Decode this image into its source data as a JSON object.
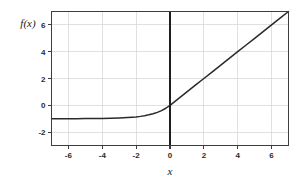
{
  "chart_data": {
    "type": "line",
    "title": "",
    "subtitle": "",
    "xlabel": "x",
    "ylabel": "f(x)",
    "xlim": [
      -7,
      7
    ],
    "ylim": [
      -3,
      7
    ],
    "xticks": [
      -6,
      -4,
      -2,
      0,
      2,
      4,
      6
    ],
    "xtick_labels": [
      "-6",
      "-4",
      "-2",
      "0",
      "2",
      "4",
      "6"
    ],
    "yticks": [
      -2,
      0,
      2,
      4,
      6
    ],
    "ytick_labels": [
      "-2",
      "0",
      "2",
      "4",
      "6"
    ],
    "grid": true,
    "legend": null,
    "legend_position": "none",
    "annotations": [],
    "colors": {
      "curve": "#2a2a2a",
      "grid": "#d8d8d8",
      "frame": "#3d3d3d",
      "zero_axis": "#1e1e1e",
      "background": "#ffffff",
      "text": "#2b2b2b"
    },
    "series": [
      {
        "name": "f(x)",
        "description": "ELU activation: f(x) = x for x >= 0, f(x) = exp(x) - 1 for x < 0",
        "asymptote_y": -1,
        "x": [
          -7,
          -6.5,
          -6,
          -5.5,
          -5,
          -4.5,
          -4,
          -3.5,
          -3,
          -2.75,
          -2.5,
          -2.25,
          -2,
          -1.75,
          -1.5,
          -1.25,
          -1,
          -0.75,
          -0.5,
          -0.25,
          0,
          0.5,
          1,
          1.5,
          2,
          2.5,
          3,
          3.5,
          4,
          4.5,
          5,
          5.5,
          6,
          6.5,
          7
        ],
        "y": [
          -0.999,
          -0.998,
          -0.998,
          -0.996,
          -0.993,
          -0.989,
          -0.982,
          -0.97,
          -0.95,
          -0.936,
          -0.918,
          -0.895,
          -0.865,
          -0.826,
          -0.777,
          -0.713,
          -0.632,
          -0.528,
          -0.393,
          -0.221,
          0,
          0.5,
          1,
          1.5,
          2,
          2.5,
          3,
          3.5,
          4,
          4.5,
          5,
          5.5,
          6,
          6.5,
          7
        ]
      }
    ]
  },
  "figure": {
    "xlabel_text": "x",
    "ylabel_text": "f(x)"
  }
}
